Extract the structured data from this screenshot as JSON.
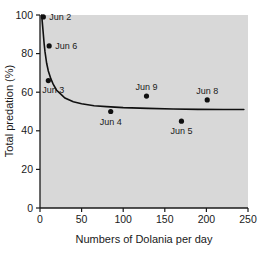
{
  "chart_data": {
    "type": "scatter",
    "title": "",
    "xlabel": "Numbers of Dolania per day",
    "ylabel": "Total predation (%)",
    "xlim": [
      0,
      250
    ],
    "ylim": [
      0,
      100
    ],
    "xticks": [
      0,
      50,
      100,
      150,
      200,
      250
    ],
    "yticks": [
      0,
      20,
      40,
      60,
      80,
      100
    ],
    "xtick_labels": [
      "0",
      "50",
      "100",
      "150",
      "200",
      "250"
    ],
    "ytick_labels": [
      "0",
      "20",
      "40",
      "60",
      "80",
      "100"
    ],
    "grid": false,
    "legend": "none",
    "plot_background": "#d8d8d8",
    "marker_color": "#101010",
    "curve_color": "#101010",
    "points": [
      {
        "label": "Jun 2",
        "x": 4,
        "y": 99,
        "label_pos": "right"
      },
      {
        "label": "Jun 6",
        "x": 11,
        "y": 84,
        "label_pos": "right"
      },
      {
        "label": "Jun 3",
        "x": 10,
        "y": 66,
        "label_pos": "below-left"
      },
      {
        "label": "Jun 4",
        "x": 85,
        "y": 50,
        "label_pos": "below"
      },
      {
        "label": "Jun 9",
        "x": 128,
        "y": 58,
        "label_pos": "above"
      },
      {
        "label": "Jun 5",
        "x": 170,
        "y": 45,
        "label_pos": "below"
      },
      {
        "label": "Jun 8",
        "x": 201,
        "y": 56,
        "label_pos": "above"
      }
    ],
    "fitted_curve": {
      "description": "decaying curve approaching asymptote near 51%",
      "asymptote": 51,
      "x_start": 2,
      "x_end": 245,
      "points": [
        [
          2,
          100
        ],
        [
          3,
          95
        ],
        [
          4,
          90
        ],
        [
          5,
          85
        ],
        [
          6,
          81
        ],
        [
          8,
          75
        ],
        [
          10,
          71
        ],
        [
          13,
          67
        ],
        [
          16,
          64
        ],
        [
          20,
          61
        ],
        [
          25,
          59
        ],
        [
          30,
          57
        ],
        [
          40,
          55
        ],
        [
          50,
          54
        ],
        [
          65,
          53
        ],
        [
          80,
          52.5
        ],
        [
          100,
          52
        ],
        [
          130,
          51.6
        ],
        [
          160,
          51.3
        ],
        [
          190,
          51.1
        ],
        [
          220,
          51
        ],
        [
          245,
          51
        ]
      ]
    }
  }
}
